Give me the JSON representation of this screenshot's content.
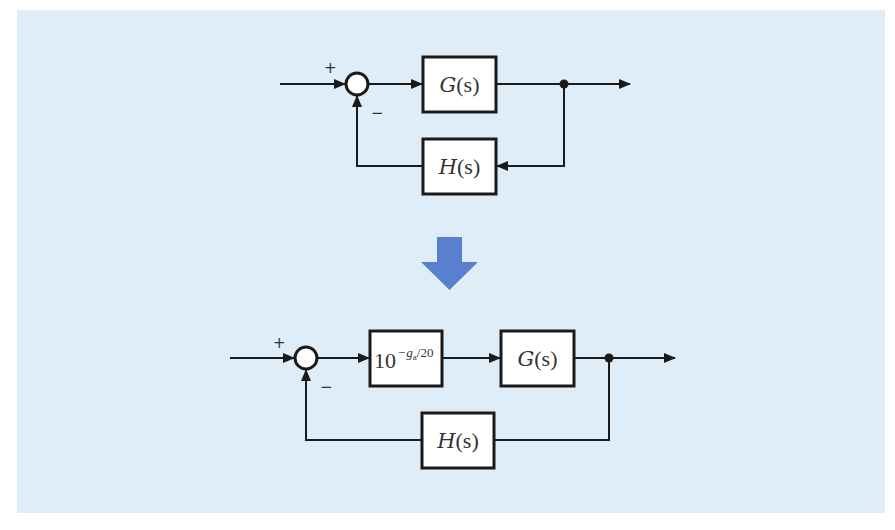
{
  "colors": {
    "background": "#deedf8",
    "line": "#1a1a1a",
    "block_fill": "#ffffff",
    "transform_arrow": "#5b7fcf"
  },
  "top_diagram": {
    "summing_junction": {
      "plus_sign": "+",
      "minus_sign": "−"
    },
    "forward_block": {
      "label": "G(s)",
      "func": "G",
      "arg": "(s)"
    },
    "feedback_block": {
      "label": "H(s)",
      "func": "H",
      "arg": "(s)"
    }
  },
  "transform_arrow": {
    "icon": "down-arrow-icon"
  },
  "bottom_diagram": {
    "summing_junction": {
      "plus_sign": "+",
      "minus_sign": "−"
    },
    "gain_block": {
      "label": "10^(-g_a/20)",
      "base": "10",
      "exponent_sign": "−",
      "exponent_var": "g",
      "exponent_sub": "a",
      "exponent_rest": "/20"
    },
    "forward_block": {
      "label": "G(s)",
      "func": "G",
      "arg": "(s)"
    },
    "feedback_block": {
      "label": "H(s)",
      "func": "H",
      "arg": "(s)"
    }
  }
}
